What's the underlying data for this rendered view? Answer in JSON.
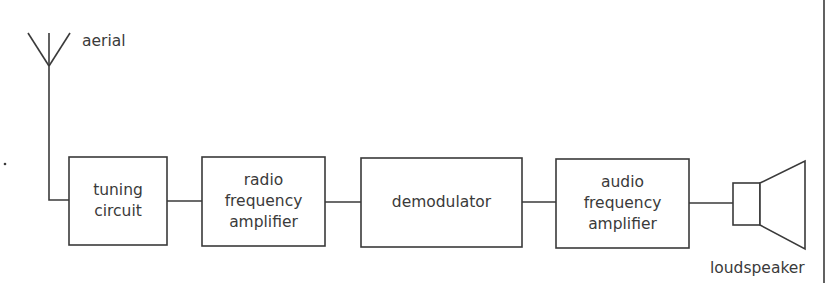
{
  "diagram": {
    "type": "block-diagram",
    "title": "",
    "aerial_label": "aerial",
    "loudspeaker_label": "loudspeaker",
    "blocks": [
      {
        "id": "tuning",
        "lines": [
          "tuning",
          "circuit"
        ]
      },
      {
        "id": "rf_amp",
        "lines": [
          "radio",
          "frequency",
          "amplifier"
        ]
      },
      {
        "id": "demod",
        "lines": [
          "demodulator"
        ]
      },
      {
        "id": "af_amp",
        "lines": [
          "audio",
          "frequency",
          "amplifier"
        ]
      }
    ],
    "connections": [
      [
        "aerial",
        "tuning"
      ],
      [
        "tuning",
        "rf_amp"
      ],
      [
        "rf_amp",
        "demod"
      ],
      [
        "demod",
        "af_amp"
      ],
      [
        "af_amp",
        "loudspeaker"
      ]
    ],
    "colors": {
      "line": "#3a3a3a",
      "background": "#ffffff"
    }
  }
}
